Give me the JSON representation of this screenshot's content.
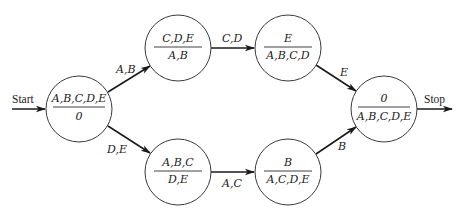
{
  "diagram": {
    "type": "state-transition-graph",
    "start_label": "Start",
    "stop_label": "Stop",
    "nodes": [
      {
        "id": "n0",
        "top": "A,B,C,D,E",
        "bottom": "0",
        "cx": 79,
        "cy": 109
      },
      {
        "id": "n1",
        "top": "C,D,E",
        "bottom": "A,B",
        "cx": 178,
        "cy": 48
      },
      {
        "id": "n2",
        "top": "A,B,C",
        "bottom": "D,E",
        "cx": 178,
        "cy": 172
      },
      {
        "id": "n3",
        "top": "E",
        "bottom": "A,B,C,D",
        "cx": 288,
        "cy": 48
      },
      {
        "id": "n4",
        "top": "B",
        "bottom": "A,C,D,E",
        "cx": 288,
        "cy": 172
      },
      {
        "id": "n5",
        "top": "0",
        "bottom": "A,B,C,D,E",
        "cx": 384,
        "cy": 109
      }
    ],
    "edges": [
      {
        "from": "n0",
        "to": "n1",
        "label": "A,B"
      },
      {
        "from": "n0",
        "to": "n2",
        "label": "D,E"
      },
      {
        "from": "n1",
        "to": "n3",
        "label": "C,D"
      },
      {
        "from": "n2",
        "to": "n4",
        "label": "A,C"
      },
      {
        "from": "n3",
        "to": "n5",
        "label": "E"
      },
      {
        "from": "n4",
        "to": "n5",
        "label": "B"
      }
    ],
    "colors": {
      "stroke": "#1a1a1a",
      "background": "#ffffff"
    }
  }
}
